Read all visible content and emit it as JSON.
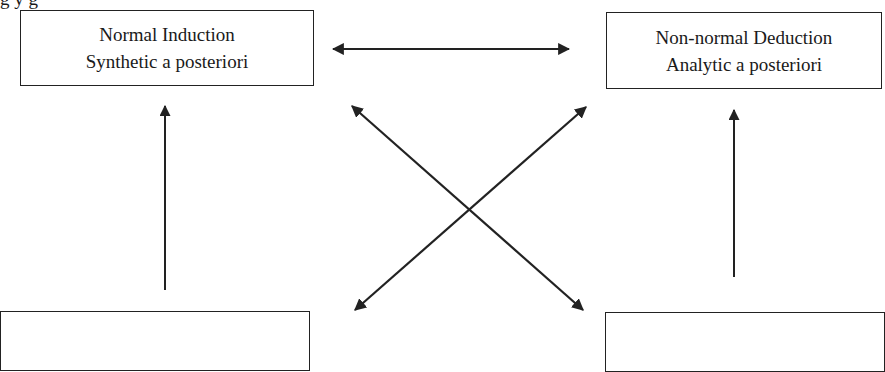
{
  "diagram": {
    "caption_partial": "g                                                    y g",
    "boxes": {
      "top_left": {
        "line1": "Normal Induction",
        "line2": "Synthetic a posteriori"
      },
      "top_right": {
        "line1": "Non-normal Deduction",
        "line2": "Analytic a posteriori"
      },
      "bottom_left": {
        "line1": "",
        "line2": ""
      },
      "bottom_right": {
        "line1": "",
        "line2": ""
      }
    },
    "connections": [
      {
        "from": "top_left",
        "to": "top_right",
        "type": "bidirectional-horizontal"
      },
      {
        "from": "bottom_left",
        "to": "top_left",
        "type": "unidirectional-up"
      },
      {
        "from": "bottom_right",
        "to": "top_right",
        "type": "unidirectional-up"
      },
      {
        "from": "top_left",
        "to": "bottom_right",
        "type": "bidirectional-diagonal"
      },
      {
        "from": "bottom_left",
        "to": "top_right",
        "type": "bidirectional-diagonal"
      }
    ],
    "colors": {
      "line": "#222222",
      "background": "#ffffff"
    }
  }
}
